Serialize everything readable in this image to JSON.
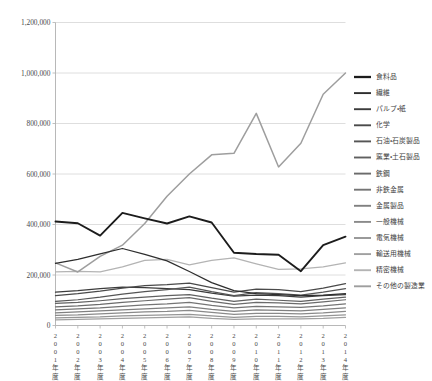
{
  "chart_data": {
    "type": "line",
    "title": "",
    "xlabel": "",
    "ylabel": "",
    "grid": true,
    "legend_position": "right",
    "ylim": [
      0,
      1200000
    ],
    "ytick_values": [
      0,
      200000,
      400000,
      600000,
      800000,
      1000000,
      1200000
    ],
    "ytick_labels": [
      "0",
      "200,000",
      "400,000",
      "600,000",
      "800,000",
      "1,000,000",
      "1,200,000"
    ],
    "categories": [
      "2001年度",
      "2002年度",
      "2003年度",
      "2004年度",
      "2005年度",
      "2006年度",
      "2007年度",
      "2008年度",
      "2009年度",
      "2010年度",
      "2011年度",
      "2012年度",
      "2013年度",
      "2014年度"
    ],
    "series": [
      {
        "name": "食料品",
        "color": "#1c1c1c",
        "values": [
          412000,
          405000,
          356000,
          446000,
          424000,
          404000,
          432000,
          408000,
          288000,
          283000,
          280000,
          215000,
          318000,
          352000
        ]
      },
      {
        "name": "繊維",
        "color": "#2e2e2e",
        "values": [
          246000,
          262000,
          284000,
          305000,
          282000,
          256000,
          214000,
          170000,
          138000,
          126000,
          122000,
          118000,
          120000,
          126000
        ]
      },
      {
        "name": "パルプ・紙",
        "color": "#3c3c3c",
        "values": [
          132000,
          138000,
          146000,
          152000,
          150000,
          146000,
          142000,
          128000,
          116000,
          120000,
          118000,
          112000,
          118000,
          122000
        ]
      },
      {
        "name": "化学",
        "color": "#4a4a4a",
        "values": [
          118000,
          126000,
          136000,
          148000,
          158000,
          162000,
          168000,
          150000,
          132000,
          144000,
          142000,
          134000,
          148000,
          166000
        ]
      },
      {
        "name": "石油・石炭製品",
        "color": "#555555",
        "values": [
          96000,
          102000,
          112000,
          124000,
          134000,
          142000,
          152000,
          134000,
          118000,
          130000,
          126000,
          120000,
          132000,
          146000
        ]
      },
      {
        "name": "窯業・土石製品",
        "color": "#606060",
        "values": [
          88000,
          92000,
          98000,
          106000,
          112000,
          118000,
          122000,
          108000,
          96000,
          104000,
          100000,
          96000,
          104000,
          112000
        ]
      },
      {
        "name": "鉄鋼",
        "color": "#6b6b6b",
        "values": [
          74000,
          78000,
          84000,
          92000,
          98000,
          104000,
          110000,
          96000,
          84000,
          92000,
          90000,
          86000,
          94000,
          102000
        ]
      },
      {
        "name": "非鉄金属",
        "color": "#757575",
        "values": [
          62000,
          66000,
          70000,
          76000,
          82000,
          86000,
          92000,
          80000,
          70000,
          76000,
          74000,
          72000,
          78000,
          86000
        ]
      },
      {
        "name": "金属製品",
        "color": "#808080",
        "values": [
          50000,
          54000,
          58000,
          62000,
          66000,
          70000,
          74000,
          64000,
          56000,
          62000,
          60000,
          58000,
          64000,
          70000
        ]
      },
      {
        "name": "一般機械",
        "color": "#8a8a8a",
        "values": [
          40000,
          42000,
          46000,
          50000,
          54000,
          56000,
          60000,
          52000,
          44000,
          48000,
          48000,
          46000,
          50000,
          56000
        ]
      },
      {
        "name": "電気機械",
        "color": "#959595",
        "values": [
          30000,
          32000,
          34000,
          38000,
          40000,
          42000,
          44000,
          38000,
          32000,
          36000,
          36000,
          34000,
          38000,
          42000
        ]
      },
      {
        "name": "輸送用機械",
        "color": "#a0a0a0",
        "values": [
          22000,
          24000,
          26000,
          28000,
          30000,
          32000,
          34000,
          28000,
          24000,
          26000,
          26000,
          26000,
          28000,
          32000
        ]
      },
      {
        "name": "精密機械",
        "color": "#b4b4b4",
        "values": [
          212000,
          214000,
          212000,
          232000,
          258000,
          262000,
          240000,
          258000,
          268000,
          244000,
          222000,
          224000,
          232000,
          248000
        ]
      },
      {
        "name": "その他の製造業",
        "color": "#9e9e9e",
        "values": [
          248000,
          212000,
          274000,
          318000,
          404000,
          512000,
          600000,
          676000,
          682000,
          840000,
          628000,
          722000,
          916000,
          1000000
        ]
      }
    ]
  }
}
